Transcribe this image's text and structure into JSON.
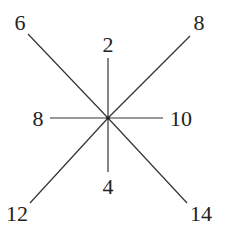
{
  "diagram": {
    "type": "star-of-rays",
    "center": {
      "x": 108,
      "y": 118
    },
    "line_color": "#333333",
    "text_color": "#222222",
    "rays": [
      {
        "id": "top-left",
        "label": "6",
        "end": {
          "x": 28,
          "y": 34
        },
        "label_pos": {
          "x": 20,
          "y": 30
        }
      },
      {
        "id": "top",
        "label": "2",
        "end": {
          "x": 108,
          "y": 58
        },
        "label_pos": {
          "x": 108,
          "y": 52
        }
      },
      {
        "id": "top-right",
        "label": "8",
        "end": {
          "x": 190,
          "y": 36
        },
        "label_pos": {
          "x": 199,
          "y": 30
        }
      },
      {
        "id": "left",
        "label": "8",
        "end": {
          "x": 50,
          "y": 118
        },
        "label_pos": {
          "x": 38,
          "y": 126
        }
      },
      {
        "id": "right",
        "label": "10",
        "end": {
          "x": 163,
          "y": 118
        },
        "label_pos": {
          "x": 181,
          "y": 126
        }
      },
      {
        "id": "bottom",
        "label": "4",
        "end": {
          "x": 108,
          "y": 172
        },
        "label_pos": {
          "x": 108,
          "y": 194
        }
      },
      {
        "id": "bottom-left",
        "label": "12",
        "end": {
          "x": 30,
          "y": 203
        },
        "label_pos": {
          "x": 17,
          "y": 221
        }
      },
      {
        "id": "bottom-right",
        "label": "14",
        "end": {
          "x": 187,
          "y": 203
        },
        "label_pos": {
          "x": 201,
          "y": 221
        }
      }
    ]
  }
}
